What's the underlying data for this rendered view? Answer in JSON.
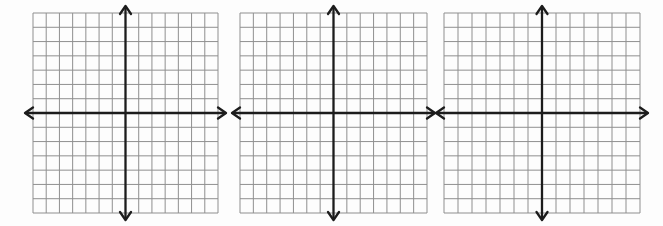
{
  "figure": {
    "background_color": "#fdfdfd"
  },
  "grid_spec": {
    "columns": 14,
    "rows": 14,
    "grid_line_color": "#8f8f8f",
    "grid_line_width": 1,
    "axis_color": "#1c1c1c",
    "axis_line_width": 2.3,
    "axis_overhang_px": 8,
    "arrowhead_length": 8,
    "arrowhead_half_width": 5.5
  },
  "panels": [
    {
      "name": "coordinate-grid-1"
    },
    {
      "name": "coordinate-grid-2"
    },
    {
      "name": "coordinate-grid-3"
    }
  ]
}
